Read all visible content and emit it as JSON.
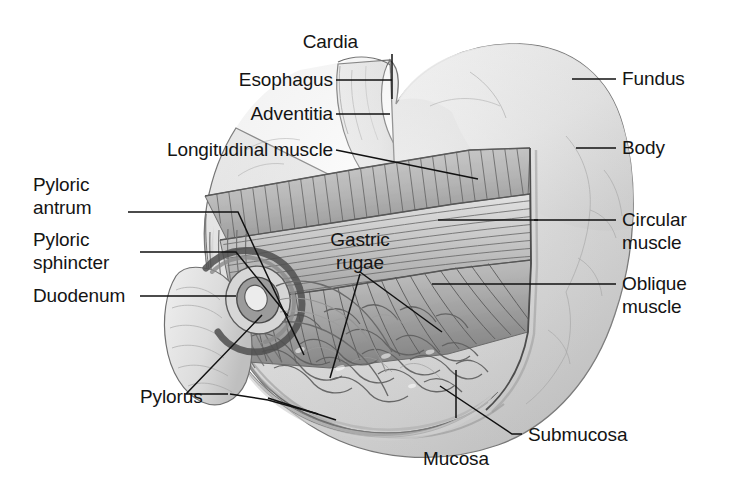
{
  "figure": {
    "background_color": "#ffffff",
    "ink_color": "#141414",
    "width": 744,
    "height": 483
  },
  "labels": {
    "cardia": "Cardia",
    "esophagus": "Esophagus",
    "adventitia": "Adventitia",
    "longitudinal_muscle": "Longitudinal muscle",
    "pyloric_antrum_line1": "Pyloric",
    "pyloric_antrum_line2": "antrum",
    "pyloric_sphincter_line1": "Pyloric",
    "pyloric_sphincter_line2": "sphincter",
    "duodenum": "Duodenum",
    "pylorus": "Pylorus",
    "gastric_rugae_line1": "Gastric",
    "gastric_rugae_line2": "rugae",
    "fundus": "Fundus",
    "body": "Body",
    "circular_muscle_line1": "Circular",
    "circular_muscle_line2": "muscle",
    "oblique_muscle_line1": "Oblique",
    "oblique_muscle_line2": "muscle",
    "submucosa": "Submucosa",
    "mucosa": "Mucosa"
  },
  "structures": [
    {
      "name": "cardia",
      "side": "top"
    },
    {
      "name": "esophagus",
      "side": "left"
    },
    {
      "name": "adventitia",
      "side": "left"
    },
    {
      "name": "longitudinal-muscle",
      "side": "left"
    },
    {
      "name": "pyloric-antrum",
      "side": "left"
    },
    {
      "name": "pyloric-sphincter",
      "side": "left"
    },
    {
      "name": "duodenum",
      "side": "left"
    },
    {
      "name": "pylorus",
      "side": "bottom-left"
    },
    {
      "name": "gastric-rugae",
      "side": "center"
    },
    {
      "name": "fundus",
      "side": "right"
    },
    {
      "name": "body",
      "side": "right"
    },
    {
      "name": "circular-muscle",
      "side": "right"
    },
    {
      "name": "oblique-muscle",
      "side": "right"
    },
    {
      "name": "submucosa",
      "side": "bottom-right"
    },
    {
      "name": "mucosa",
      "side": "bottom"
    }
  ]
}
